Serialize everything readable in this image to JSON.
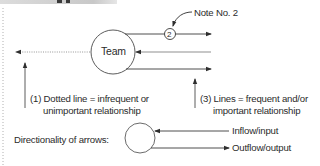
{
  "header": {
    "banner_color": "#d0d0d0"
  },
  "diagram": {
    "center_node": {
      "label": "Team"
    },
    "note_marker": {
      "label": "2"
    },
    "note_callout": {
      "label": "Note No. 2"
    },
    "annotations": [
      {
        "id": "1",
        "line1": "(1)  Dotted line  =  infrequent or",
        "line2": "unimportant relationship"
      },
      {
        "id": "3",
        "line1": "(3)  Lines  =  frequent and/or",
        "line2": "important relationship"
      }
    ],
    "legend": {
      "title": "Directionality of arrows:",
      "inflow_label": "Inflow/input",
      "outflow_label": "Outflow/output"
    },
    "colors": {
      "line": "#3a3a3a",
      "gray_line": "#9a9a9a",
      "dotted": "#8a8a8a"
    }
  }
}
